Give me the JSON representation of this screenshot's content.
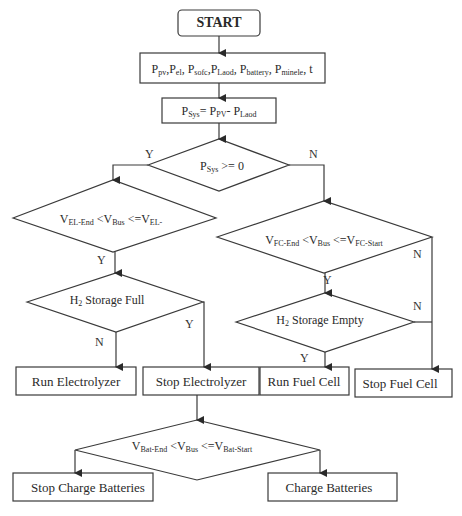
{
  "diagram": {
    "type": "flowchart",
    "nodes": {
      "start": {
        "label": "START",
        "shape": "rounded-rect"
      },
      "inputs": {
        "label_parts": [
          {
            "t": "P",
            "s": "pv"
          },
          {
            "t": ",P",
            "s": "el"
          },
          {
            "t": ", P",
            "s": "sofc"
          },
          {
            "t": ",P",
            "s": "Laod"
          },
          {
            "t": ", P",
            "s": "battery"
          },
          {
            "t": ", P",
            "s": "minele"
          },
          {
            "t": ", t",
            "s": ""
          }
        ],
        "shape": "rect"
      },
      "psys": {
        "label_parts": [
          {
            "t": "P",
            "s": "Sys"
          },
          {
            "t": "= P",
            "s": "PV"
          },
          {
            "t": "- P",
            "s": "Laod"
          }
        ],
        "shape": "rect"
      },
      "d_psys": {
        "label_parts": [
          {
            "t": "P",
            "s": "Sys"
          },
          {
            "t": " >= 0",
            "s": ""
          }
        ],
        "shape": "diamond"
      },
      "d_el": {
        "label_parts": [
          {
            "t": "V",
            "s": "EL-End"
          },
          {
            "t": " <V",
            "s": "Bus"
          },
          {
            "t": " <=V",
            "s": "EL-"
          }
        ],
        "shape": "diamond"
      },
      "d_h2full": {
        "label_parts": [
          {
            "t": "H",
            "s": "2"
          },
          {
            "t": " Storage Full",
            "s": ""
          }
        ],
        "shape": "diamond"
      },
      "run_el": {
        "label": "Run Electrolyzer",
        "shape": "rect"
      },
      "stop_el": {
        "label": "Stop Electrolyzer",
        "shape": "rect"
      },
      "d_fc": {
        "label_parts": [
          {
            "t": "V",
            "s": "FC-End"
          },
          {
            "t": " <V",
            "s": "Bus"
          },
          {
            "t": " <=V",
            "s": "FC-Start"
          }
        ],
        "shape": "diamond"
      },
      "d_h2empty": {
        "label_parts": [
          {
            "t": "H",
            "s": "2"
          },
          {
            "t": " Storage Empty",
            "s": ""
          }
        ],
        "shape": "diamond"
      },
      "run_fc": {
        "label": "Run Fuel Cell",
        "shape": "rect"
      },
      "stop_fc": {
        "label": "Stop Fuel Cell",
        "shape": "rect"
      },
      "d_bat": {
        "label_parts": [
          {
            "t": "V",
            "s": "Bat-End"
          },
          {
            "t": " <V",
            "s": "Bus"
          },
          {
            "t": " <=V",
            "s": "Bat-Start"
          }
        ],
        "shape": "diamond"
      },
      "stop_charge": {
        "label": "Stop Charge Batteries",
        "shape": "rect"
      },
      "charge": {
        "label": "Charge Batteries",
        "shape": "rect"
      }
    },
    "edge_labels": {
      "psys_yes": "Y",
      "psys_no": "N",
      "el_yes": "Y",
      "h2full_yes": "Y",
      "h2full_no": "N",
      "fc_yes": "Y",
      "fc_no": "N",
      "h2empty_yes": "Y",
      "h2empty_no": "N"
    },
    "edges": [
      [
        "start",
        "inputs"
      ],
      [
        "inputs",
        "psys"
      ],
      [
        "psys",
        "d_psys"
      ],
      [
        "d_psys",
        "d_el",
        "Y"
      ],
      [
        "d_psys",
        "d_fc",
        "N"
      ],
      [
        "d_el",
        "d_h2full",
        "Y"
      ],
      [
        "d_h2full",
        "run_el",
        "N"
      ],
      [
        "d_h2full",
        "stop_el",
        "Y"
      ],
      [
        "d_fc",
        "d_h2empty",
        "Y"
      ],
      [
        "d_fc",
        "stop_fc",
        "N"
      ],
      [
        "d_h2empty",
        "run_fc",
        "Y"
      ],
      [
        "d_h2empty",
        "stop_fc",
        "N"
      ],
      [
        "stop_el",
        "d_bat"
      ],
      [
        "d_bat",
        "stop_charge"
      ],
      [
        "d_bat",
        "charge"
      ]
    ],
    "colors": {
      "stroke": "#3a3a3a",
      "text": "#2a2a2a",
      "background": "#ffffff"
    }
  }
}
